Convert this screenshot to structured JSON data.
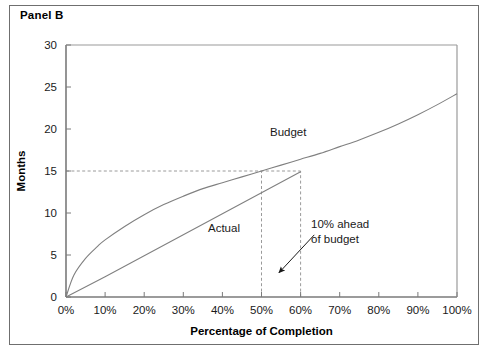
{
  "figure": {
    "panel_title": "Panel B",
    "border_color": "#6f6f6f",
    "background": "#ffffff"
  },
  "chart_data": {
    "type": "line",
    "title": "Panel B",
    "xlabel": "Percentage of Completion",
    "ylabel": "Months",
    "xlim": [
      0,
      100
    ],
    "ylim": [
      0,
      30
    ],
    "grid": false,
    "legend_position": "inline-labels",
    "x_tick_labels": [
      "0%",
      "10%",
      "20%",
      "30%",
      "40%",
      "50%",
      "60%",
      "70%",
      "80%",
      "90%",
      "100%"
    ],
    "x_tick_values": [
      0,
      10,
      20,
      30,
      40,
      50,
      60,
      70,
      80,
      90,
      100
    ],
    "y_tick_labels": [
      "0",
      "5",
      "10",
      "15",
      "20",
      "25",
      "30"
    ],
    "y_tick_values": [
      0,
      5,
      10,
      15,
      20,
      25,
      30
    ],
    "series": [
      {
        "name": "Budget",
        "label": "Budget",
        "color": "#808080",
        "x": [
          0,
          2,
          5,
          8,
          10,
          15,
          20,
          25,
          30,
          35,
          40,
          45,
          50,
          55,
          60,
          65,
          70,
          75,
          80,
          85,
          90,
          95,
          100
        ],
        "values": [
          0,
          2.6,
          4.6,
          6.0,
          6.8,
          8.4,
          9.8,
          11.0,
          12.0,
          12.9,
          13.6,
          14.3,
          15.0,
          15.7,
          16.4,
          17.1,
          17.9,
          18.7,
          19.6,
          20.6,
          21.7,
          22.9,
          24.2
        ]
      },
      {
        "name": "Actual",
        "label": "Actual",
        "color": "#808080",
        "x": [
          0,
          10,
          20,
          30,
          40,
          50,
          60
        ],
        "values": [
          0,
          2.4,
          4.9,
          7.4,
          9.9,
          12.4,
          14.9
        ]
      }
    ],
    "reference_lines": [
      {
        "name": "months-15-line",
        "orientation": "horizontal",
        "value": 15,
        "from": 0,
        "to": 60,
        "style": "dashed"
      },
      {
        "name": "budget-50pct-line",
        "orientation": "vertical",
        "value": 50,
        "from": 0,
        "to": 15,
        "style": "dashed"
      },
      {
        "name": "actual-60pct-line",
        "orientation": "vertical",
        "value": 60,
        "from": 0,
        "to": 15,
        "style": "dashed"
      }
    ],
    "annotations": [
      {
        "name": "ahead-of-budget-note",
        "line1": "10% ahead",
        "line2": "of budget",
        "arrow_from": [
          63.5,
          7.4
        ],
        "arrow_to": [
          54.5,
          2.9
        ]
      }
    ]
  }
}
